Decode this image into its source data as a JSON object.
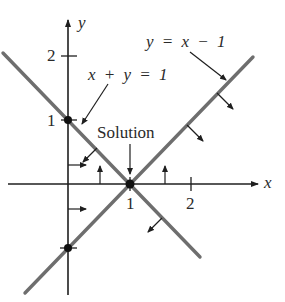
{
  "diagram": {
    "axes": {
      "x_label": "x",
      "y_label": "y",
      "x_ticks": [
        "1",
        "2"
      ],
      "y_ticks": [
        "1",
        "2"
      ]
    },
    "lines": [
      {
        "name": "x-plus-y-equals-1",
        "label": "x + y = 1",
        "color": "#6e6e6e"
      },
      {
        "name": "y-equals-x-minus-1",
        "label": "y = x − 1",
        "color": "#6e6e6e"
      }
    ],
    "annotation": {
      "label": "Solution",
      "point": [
        1,
        0
      ]
    },
    "points": [
      {
        "name": "y-intercept-line1",
        "coords": [
          0,
          1
        ]
      },
      {
        "name": "solution",
        "coords": [
          1,
          0
        ]
      },
      {
        "name": "y-intercept-line2",
        "coords": [
          0,
          -1
        ]
      }
    ],
    "colors": {
      "axis": "#1f1f1f",
      "line": "#6e6e6e",
      "text": "#2a2a2a"
    }
  }
}
